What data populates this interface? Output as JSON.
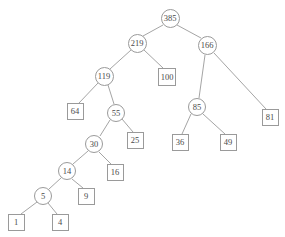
{
  "figure": {
    "width": 285,
    "height": 237,
    "background": "#ffffff",
    "edge_color": "#9a9a9a",
    "node_stroke": "#9a9a9a",
    "node_fill": "#ffffff",
    "text_color": "#4a4a4a"
  },
  "chart_data": {
    "type": "diagram",
    "diagram_kind": "binary-tree",
    "title": "",
    "nodes": [
      {
        "id": "n385",
        "label": "385",
        "shape": "circle",
        "x": 170,
        "y": 18,
        "r": 9.5,
        "font_size": 8.5
      },
      {
        "id": "n219",
        "label": "219",
        "shape": "circle",
        "x": 137,
        "y": 43,
        "r": 9.5,
        "font_size": 8.5
      },
      {
        "id": "n166",
        "label": "166",
        "shape": "circle",
        "x": 207,
        "y": 45,
        "r": 9.5,
        "font_size": 8.5
      },
      {
        "id": "n119",
        "label": "119",
        "shape": "circle",
        "x": 104,
        "y": 76,
        "r": 9.5,
        "font_size": 8.5
      },
      {
        "id": "n100",
        "label": "100",
        "shape": "square",
        "x": 167,
        "y": 77,
        "w": 18,
        "h": 18,
        "font_size": 8.5
      },
      {
        "id": "n85",
        "label": "85",
        "shape": "circle",
        "x": 197,
        "y": 107,
        "r": 9,
        "font_size": 8.5
      },
      {
        "id": "n81",
        "label": "81",
        "shape": "square",
        "x": 270,
        "y": 117,
        "w": 17,
        "h": 17,
        "font_size": 8.5
      },
      {
        "id": "n64",
        "label": "64",
        "shape": "square",
        "x": 75,
        "y": 111,
        "w": 17,
        "h": 17,
        "font_size": 8.5
      },
      {
        "id": "n55",
        "label": "55",
        "shape": "circle",
        "x": 116,
        "y": 113,
        "r": 9,
        "font_size": 8.5
      },
      {
        "id": "n36",
        "label": "36",
        "shape": "square",
        "x": 180,
        "y": 142,
        "w": 17,
        "h": 17,
        "font_size": 8.5
      },
      {
        "id": "n49",
        "label": "49",
        "shape": "square",
        "x": 228,
        "y": 142,
        "w": 17,
        "h": 17,
        "font_size": 8.5
      },
      {
        "id": "n30",
        "label": "30",
        "shape": "circle",
        "x": 94,
        "y": 144,
        "r": 9,
        "font_size": 8.5
      },
      {
        "id": "n25",
        "label": "25",
        "shape": "square",
        "x": 135,
        "y": 140,
        "w": 17,
        "h": 17,
        "font_size": 8.5
      },
      {
        "id": "n14",
        "label": "14",
        "shape": "circle",
        "x": 67,
        "y": 171,
        "r": 9,
        "font_size": 8.5
      },
      {
        "id": "n16",
        "label": "16",
        "shape": "square",
        "x": 115,
        "y": 172,
        "w": 17,
        "h": 17,
        "font_size": 8.5
      },
      {
        "id": "n5",
        "label": "5",
        "shape": "circle",
        "x": 43,
        "y": 196,
        "r": 9,
        "font_size": 8.5
      },
      {
        "id": "n9",
        "label": "9",
        "shape": "square",
        "x": 86,
        "y": 196,
        "w": 17,
        "h": 17,
        "font_size": 8.5
      },
      {
        "id": "n1",
        "label": "1",
        "shape": "square",
        "x": 16,
        "y": 222,
        "w": 17,
        "h": 17,
        "font_size": 8.5
      },
      {
        "id": "n4",
        "label": "4",
        "shape": "square",
        "x": 60,
        "y": 222,
        "w": 17,
        "h": 17,
        "font_size": 8.5
      }
    ],
    "edges": [
      {
        "from": "n385",
        "to": "n219",
        "x1": 163,
        "y1": 25,
        "x2": 143,
        "y2": 36
      },
      {
        "from": "n385",
        "to": "n166",
        "x1": 177,
        "y1": 25,
        "x2": 201,
        "y2": 38
      },
      {
        "from": "n219",
        "to": "n119",
        "x1": 131,
        "y1": 50,
        "x2": 110,
        "y2": 69
      },
      {
        "from": "n219",
        "to": "n100",
        "x1": 144,
        "y1": 50,
        "x2": 163,
        "y2": 68
      },
      {
        "from": "n166",
        "to": "n85",
        "x1": 205,
        "y1": 55,
        "x2": 199,
        "y2": 98
      },
      {
        "from": "n166",
        "to": "n81",
        "x1": 214,
        "y1": 53,
        "x2": 266,
        "y2": 109
      },
      {
        "from": "n119",
        "to": "n64",
        "x1": 98,
        "y1": 83,
        "x2": 79,
        "y2": 103
      },
      {
        "from": "n119",
        "to": "n55",
        "x1": 108,
        "y1": 85,
        "x2": 114,
        "y2": 104
      },
      {
        "from": "n85",
        "to": "n36",
        "x1": 191,
        "y1": 114,
        "x2": 182,
        "y2": 134
      },
      {
        "from": "n85",
        "to": "n49",
        "x1": 203,
        "y1": 114,
        "x2": 225,
        "y2": 134
      },
      {
        "from": "n55",
        "to": "n30",
        "x1": 110,
        "y1": 120,
        "x2": 100,
        "y2": 136
      },
      {
        "from": "n55",
        "to": "n25",
        "x1": 122,
        "y1": 119,
        "x2": 133,
        "y2": 132
      },
      {
        "from": "n30",
        "to": "n14",
        "x1": 88,
        "y1": 151,
        "x2": 73,
        "y2": 164
      },
      {
        "from": "n30",
        "to": "n16",
        "x1": 99,
        "y1": 152,
        "x2": 111,
        "y2": 164
      },
      {
        "from": "n14",
        "to": "n5",
        "x1": 61,
        "y1": 178,
        "x2": 49,
        "y2": 189
      },
      {
        "from": "n14",
        "to": "n9",
        "x1": 72,
        "y1": 179,
        "x2": 83,
        "y2": 188
      },
      {
        "from": "n5",
        "to": "n1",
        "x1": 37,
        "y1": 202,
        "x2": 21,
        "y2": 214
      },
      {
        "from": "n5",
        "to": "n4",
        "x1": 48,
        "y1": 203,
        "x2": 57,
        "y2": 214
      }
    ]
  }
}
